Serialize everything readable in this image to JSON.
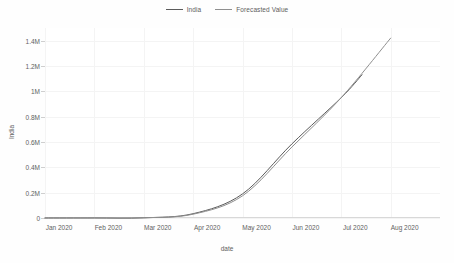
{
  "chart_data": {
    "type": "line",
    "title": "",
    "xlabel": "date",
    "ylabel": "India",
    "grid": true,
    "legend_position": "top-center",
    "xlim": [
      "Jan 2020",
      "Aug 2020"
    ],
    "ylim": [
      0,
      1500000
    ],
    "x_tick_labels": [
      "Jan 2020",
      "Feb 2020",
      "Mar 2020",
      "Apr 2020",
      "May 2020",
      "Jun 2020",
      "Jul 2020",
      "Aug 2020"
    ],
    "y_tick_labels": [
      "0",
      "0.2M",
      "0.4M",
      "0.6M",
      "0.8M",
      "1M",
      "1.2M",
      "1.4M"
    ],
    "y_tick_values": [
      0,
      200000,
      400000,
      600000,
      800000,
      1000000,
      1200000,
      1400000
    ],
    "series": [
      {
        "name": "India",
        "color": "#5b5b5b",
        "x": [
          "Jan 2020",
          "Feb 2020",
          "Mar 2020",
          "Apr 2020",
          "May 2020",
          "Jun 2020",
          "Jul 2020",
          "Jul 18 2020"
        ],
        "values": [
          0,
          300,
          1400,
          34000,
          190000,
          585000,
          1000000,
          0
        ],
        "points": [
          {
            "x": "Jan 2020",
            "y": 0
          },
          {
            "x": "Feb 2020",
            "y": 300
          },
          {
            "x": "Mar 2020",
            "y": 1400
          },
          {
            "x": "Apr 2020",
            "y": 34000
          },
          {
            "x": "May 2020",
            "y": 190000
          },
          {
            "x": "Jun 2020",
            "y": 585000
          },
          {
            "x": "Jul 2020",
            "y": 950000
          }
        ],
        "note": "observed data ends mid-July near 0.95M"
      },
      {
        "name": "Forecasted Value",
        "color": "#8f8f8f",
        "x": [
          "Jan 2020",
          "Feb 2020",
          "Mar 2020",
          "Apr 2020",
          "May 2020",
          "Jun 2020",
          "Jul 2020",
          "Aug 2020"
        ],
        "values": [
          0,
          500,
          2000,
          30000,
          175000,
          560000,
          950000,
          1420000
        ],
        "points": [
          {
            "x": "Jan 2020",
            "y": 0
          },
          {
            "x": "Feb 2020",
            "y": 500
          },
          {
            "x": "Mar 2020",
            "y": 2000
          },
          {
            "x": "Apr 2020",
            "y": 30000
          },
          {
            "x": "May 2020",
            "y": 175000
          },
          {
            "x": "Jun 2020",
            "y": 560000
          },
          {
            "x": "Jul 2020",
            "y": 950000
          },
          {
            "x": "Aug 2020",
            "y": 1420000
          }
        ],
        "note": "forecast continues to end of range at about 1.42M"
      }
    ]
  },
  "legend": {
    "items": [
      {
        "label": "India",
        "color": "#5b5b5b"
      },
      {
        "label": "Forecasted Value",
        "color": "#8f8f8f"
      }
    ]
  },
  "axes": {
    "y_title": "India",
    "x_title": "date"
  }
}
